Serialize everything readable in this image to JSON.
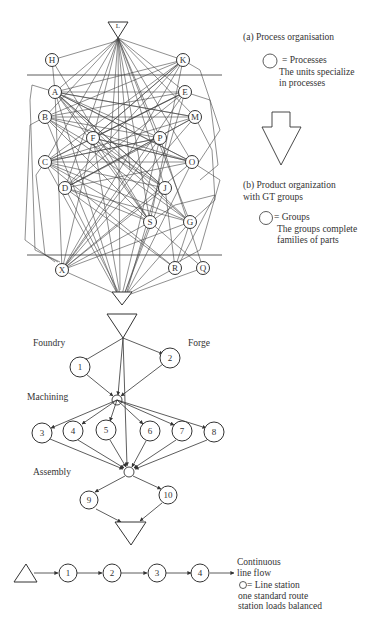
{
  "figure": {
    "panel_a": {
      "title": "(a) Process organisation",
      "legend_symbol": "circle",
      "legend_line1": "= Processes",
      "legend_line2": "The units specialize",
      "legend_line3": "in processes",
      "nodes": [
        "L",
        "H",
        "K",
        "A",
        "E",
        "B",
        "M",
        "F",
        "P",
        "C",
        "O",
        "D",
        "J",
        "S",
        "G",
        "X",
        "R",
        "Q"
      ]
    },
    "transition_arrow": "down-arrow",
    "panel_b": {
      "title_line1": "(b) Product organization",
      "title_line2": "with GT groups",
      "legend_symbol": "circle",
      "legend_line1": "= Groups",
      "legend_line2": "The groups complete",
      "legend_line3": "families of parts",
      "stage_labels": {
        "foundry": "Foundry",
        "forge": "Forge",
        "machining": "Machining",
        "assembly": "Assembly"
      },
      "groups": {
        "g1": "1",
        "g2": "2",
        "g3": "3",
        "g4": "4",
        "g5": "5",
        "g6": "6",
        "g7": "7",
        "g8": "8",
        "g9": "9",
        "g10": "10"
      }
    },
    "panel_c": {
      "stations": [
        "1",
        "2",
        "3",
        "4"
      ],
      "title_line1": "Continuous",
      "title_line2": "line flow",
      "legend_line1": "= Line station",
      "legend_line2": "one standard route",
      "legend_line3": "station loads balanced"
    },
    "colors": {
      "ink": "#333333",
      "background": "#ffffff"
    }
  }
}
